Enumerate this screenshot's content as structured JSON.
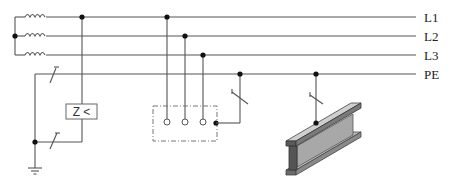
{
  "diagram": {
    "title": "",
    "bus_labels": [
      {
        "id": "L1",
        "label": "L1"
      },
      {
        "id": "L2",
        "label": "L2"
      },
      {
        "id": "L3",
        "label": "L3"
      },
      {
        "id": "PE",
        "label": "PE"
      }
    ],
    "relay_label": "Z <",
    "colors": {
      "wire": "#555555",
      "node": "#111111",
      "beam_light": "#c8c8c8",
      "beam_mid": "#9a9a9a",
      "beam_dark": "#555555"
    }
  }
}
